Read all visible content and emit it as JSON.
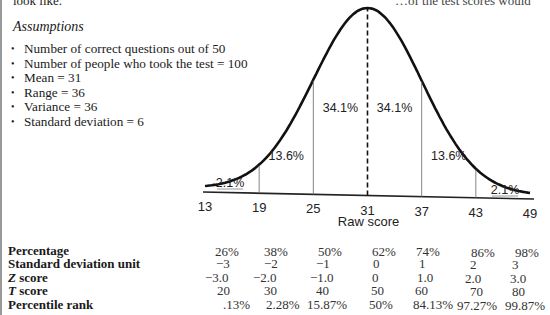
{
  "header": {
    "intro_left": "look like.",
    "intro_right": "…of the test scores would"
  },
  "assumptions": {
    "title": "Assumptions",
    "items": [
      "Number of correct questions out of 50",
      "Number of people who took the test = 100",
      "Mean = 31",
      "Range = 36",
      "Variance = 36",
      "Standard deviation = 6"
    ]
  },
  "chart_data": {
    "type": "area",
    "xlabel": "Raw score",
    "ylabel": "",
    "distribution": "normal",
    "mean": 31,
    "sd": 6,
    "xlim": [
      13,
      49
    ],
    "x_ticks": [
      13,
      19,
      25,
      31,
      37,
      43,
      49
    ],
    "tick_labels": [
      "13",
      "19",
      "25",
      "31",
      "37",
      "43",
      "49"
    ],
    "dividers": [
      19,
      25,
      31,
      37,
      43
    ],
    "mean_line_style": "dashed",
    "regions": [
      {
        "from": 13,
        "to": 19,
        "label": "2.1%",
        "value": 2.1
      },
      {
        "from": 19,
        "to": 25,
        "label": "13.6%",
        "value": 13.6
      },
      {
        "from": 25,
        "to": 31,
        "label": "34.1%",
        "value": 34.1
      },
      {
        "from": 31,
        "to": 37,
        "label": "34.1%",
        "value": 34.1
      },
      {
        "from": 37,
        "to": 43,
        "label": "13.6%",
        "value": 13.6
      },
      {
        "from": 43,
        "to": 49,
        "label": "2.1%",
        "value": 2.1
      }
    ],
    "grid": false,
    "legend": "none"
  },
  "table": {
    "rows": [
      {
        "label": "Percentage",
        "label_italic": "",
        "values": [
          "26%",
          "38%",
          "50%",
          "62%",
          "74%",
          "86%",
          "98%"
        ]
      },
      {
        "label": "Standard deviation unit",
        "label_italic": "",
        "values": [
          "−3",
          "−2",
          "−1",
          "0",
          "1",
          "2",
          "3"
        ]
      },
      {
        "label": " score",
        "label_italic": "Z",
        "values": [
          "−3.0",
          "−2.0",
          "−1.0",
          "0",
          "1.0",
          "2.0",
          "3.0"
        ]
      },
      {
        "label": " score",
        "label_italic": "T",
        "values": [
          "20",
          "30",
          "40",
          "50",
          "60",
          "70",
          "80"
        ]
      },
      {
        "label": "Percentile rank",
        "label_italic": "",
        "values": [
          ".13%",
          "2.28%",
          "15.87%",
          "50%",
          "84.13%",
          "97.27%",
          "99.87%"
        ]
      }
    ]
  }
}
